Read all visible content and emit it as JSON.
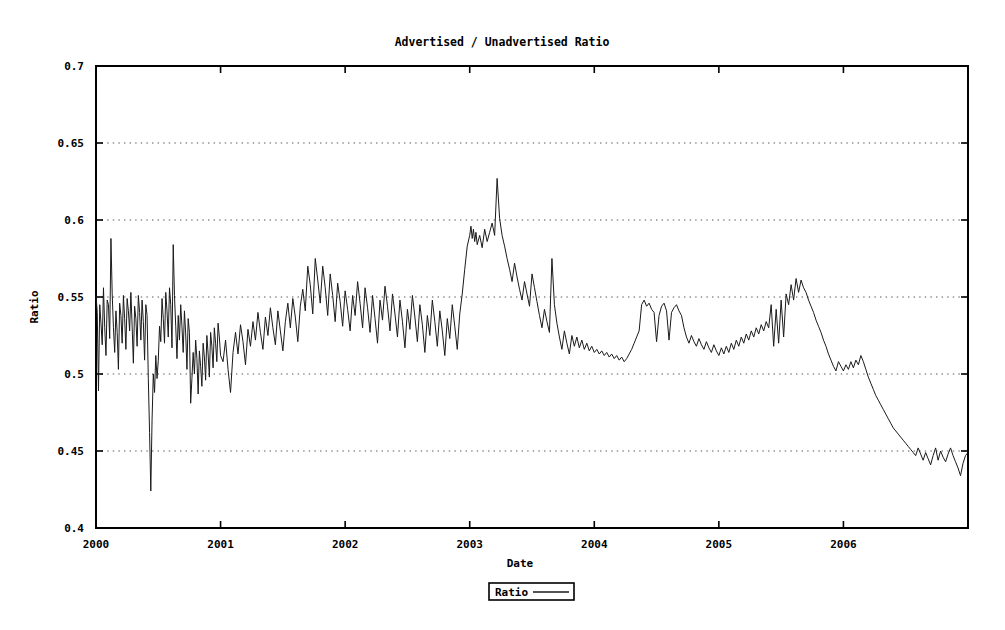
{
  "chart_data": {
    "type": "line",
    "title": "Advertised / Unadvertised Ratio",
    "xlabel": "Date",
    "ylabel": "Ratio",
    "ylim": [
      0.4,
      0.7
    ],
    "xlim": [
      2000.0,
      2007.0
    ],
    "ytick_labels": [
      "0.4",
      "0.45",
      "0.5",
      "0.55",
      "0.6",
      "0.65",
      "0.7"
    ],
    "ytick_values": [
      0.4,
      0.45,
      0.5,
      0.55,
      0.6,
      0.65,
      0.7
    ],
    "xtick_labels": [
      "2000",
      "2001",
      "2002",
      "2003",
      "2004",
      "2005",
      "2006",
      ""
    ],
    "xtick_values": [
      2000,
      2001,
      2002,
      2003,
      2004,
      2005,
      2006,
      2007
    ],
    "grid": true,
    "grid_style": "dotted",
    "legend_position": "below-center",
    "series": [
      {
        "name": "Ratio",
        "color": "#1a1a1a",
        "x": [
          2000.0,
          2000.01,
          2000.02,
          2000.03,
          2000.04,
          2000.05,
          2000.06,
          2000.07,
          2000.08,
          2000.09,
          2000.1,
          2000.11,
          2000.12,
          2000.13,
          2000.14,
          2000.15,
          2000.16,
          2000.17,
          2000.18,
          2000.19,
          2000.2,
          2000.21,
          2000.22,
          2000.23,
          2000.24,
          2000.25,
          2000.26,
          2000.27,
          2000.28,
          2000.29,
          2000.3,
          2000.31,
          2000.32,
          2000.33,
          2000.34,
          2000.35,
          2000.36,
          2000.37,
          2000.38,
          2000.39,
          2000.4,
          2000.41,
          2000.42,
          2000.43,
          2000.44,
          2000.45,
          2000.46,
          2000.47,
          2000.48,
          2000.49,
          2000.5,
          2000.51,
          2000.52,
          2000.53,
          2000.54,
          2000.55,
          2000.56,
          2000.57,
          2000.58,
          2000.59,
          2000.6,
          2000.61,
          2000.62,
          2000.63,
          2000.64,
          2000.65,
          2000.66,
          2000.67,
          2000.68,
          2000.69,
          2000.7,
          2000.71,
          2000.72,
          2000.73,
          2000.74,
          2000.75,
          2000.76,
          2000.77,
          2000.78,
          2000.79,
          2000.8,
          2000.81,
          2000.82,
          2000.83,
          2000.84,
          2000.85,
          2000.86,
          2000.87,
          2000.88,
          2000.89,
          2000.9,
          2000.91,
          2000.92,
          2000.93,
          2000.94,
          2000.95,
          2000.96,
          2000.97,
          2000.98,
          2000.99,
          2001.0,
          2001.02,
          2001.04,
          2001.06,
          2001.08,
          2001.1,
          2001.12,
          2001.14,
          2001.16,
          2001.18,
          2001.2,
          2001.22,
          2001.24,
          2001.26,
          2001.28,
          2001.3,
          2001.32,
          2001.34,
          2001.36,
          2001.38,
          2001.4,
          2001.42,
          2001.44,
          2001.46,
          2001.48,
          2001.5,
          2001.52,
          2001.54,
          2001.56,
          2001.58,
          2001.6,
          2001.62,
          2001.64,
          2001.66,
          2001.68,
          2001.7,
          2001.72,
          2001.74,
          2001.76,
          2001.78,
          2001.8,
          2001.82,
          2001.84,
          2001.86,
          2001.88,
          2001.9,
          2001.92,
          2001.94,
          2001.96,
          2001.98,
          2002.0,
          2002.02,
          2002.04,
          2002.06,
          2002.08,
          2002.1,
          2002.12,
          2002.14,
          2002.16,
          2002.18,
          2002.2,
          2002.22,
          2002.24,
          2002.26,
          2002.28,
          2002.3,
          2002.32,
          2002.34,
          2002.36,
          2002.38,
          2002.4,
          2002.42,
          2002.44,
          2002.46,
          2002.48,
          2002.5,
          2002.52,
          2002.54,
          2002.56,
          2002.58,
          2002.6,
          2002.62,
          2002.64,
          2002.66,
          2002.68,
          2002.7,
          2002.72,
          2002.74,
          2002.76,
          2002.78,
          2002.8,
          2002.82,
          2002.84,
          2002.86,
          2002.88,
          2002.9,
          2002.92,
          2002.94,
          2002.96,
          2002.98,
          2003.0,
          2003.01,
          2003.02,
          2003.03,
          2003.04,
          2003.05,
          2003.06,
          2003.08,
          2003.1,
          2003.12,
          2003.14,
          2003.16,
          2003.18,
          2003.2,
          2003.22,
          2003.24,
          2003.26,
          2003.28,
          2003.3,
          2003.32,
          2003.34,
          2003.36,
          2003.38,
          2003.4,
          2003.42,
          2003.44,
          2003.46,
          2003.48,
          2003.5,
          2003.52,
          2003.54,
          2003.56,
          2003.58,
          2003.6,
          2003.62,
          2003.64,
          2003.66,
          2003.68,
          2003.7,
          2003.72,
          2003.74,
          2003.76,
          2003.78,
          2003.8,
          2003.82,
          2003.84,
          2003.86,
          2003.88,
          2003.9,
          2003.92,
          2003.94,
          2003.96,
          2003.98,
          2004.0,
          2004.02,
          2004.04,
          2004.06,
          2004.08,
          2004.1,
          2004.12,
          2004.14,
          2004.16,
          2004.18,
          2004.2,
          2004.22,
          2004.24,
          2004.26,
          2004.28,
          2004.3,
          2004.32,
          2004.34,
          2004.36,
          2004.38,
          2004.4,
          2004.42,
          2004.44,
          2004.46,
          2004.48,
          2004.5,
          2004.52,
          2004.54,
          2004.56,
          2004.58,
          2004.6,
          2004.62,
          2004.64,
          2004.66,
          2004.68,
          2004.7,
          2004.72,
          2004.74,
          2004.76,
          2004.78,
          2004.8,
          2004.82,
          2004.84,
          2004.86,
          2004.88,
          2004.9,
          2004.92,
          2004.94,
          2004.96,
          2004.98,
          2005.0,
          2005.02,
          2005.04,
          2005.06,
          2005.08,
          2005.1,
          2005.12,
          2005.14,
          2005.16,
          2005.18,
          2005.2,
          2005.22,
          2005.24,
          2005.26,
          2005.28,
          2005.3,
          2005.32,
          2005.34,
          2005.36,
          2005.38,
          2005.4,
          2005.42,
          2005.44,
          2005.46,
          2005.48,
          2005.5,
          2005.52,
          2005.54,
          2005.56,
          2005.58,
          2005.6,
          2005.62,
          2005.64,
          2005.66,
          2005.68,
          2005.7,
          2005.72,
          2005.74,
          2005.76,
          2005.78,
          2005.8,
          2005.82,
          2005.84,
          2005.86,
          2005.88,
          2005.9,
          2005.92,
          2005.94,
          2005.96,
          2005.98,
          2006.0,
          2006.02,
          2006.04,
          2006.06,
          2006.08,
          2006.1,
          2006.12,
          2006.14,
          2006.16,
          2006.18,
          2006.2,
          2006.22,
          2006.24,
          2006.26,
          2006.28,
          2006.3,
          2006.32,
          2006.34,
          2006.36,
          2006.38,
          2006.4,
          2006.42,
          2006.44,
          2006.46,
          2006.48,
          2006.5,
          2006.52,
          2006.54,
          2006.56,
          2006.58,
          2006.6,
          2006.62,
          2006.64,
          2006.66,
          2006.68,
          2006.7,
          2006.72,
          2006.74,
          2006.76,
          2006.78,
          2006.8,
          2006.82,
          2006.84,
          2006.86,
          2006.88,
          2006.9,
          2006.92,
          2006.94,
          2006.96,
          2006.98,
          2007.0
        ],
        "y": [
          0.551,
          0.54,
          0.489,
          0.545,
          0.533,
          0.519,
          0.556,
          0.53,
          0.512,
          0.548,
          0.545,
          0.523,
          0.588,
          0.552,
          0.53,
          0.514,
          0.541,
          0.527,
          0.503,
          0.546,
          0.538,
          0.52,
          0.551,
          0.536,
          0.516,
          0.549,
          0.541,
          0.528,
          0.553,
          0.531,
          0.507,
          0.544,
          0.536,
          0.518,
          0.551,
          0.54,
          0.522,
          0.548,
          0.534,
          0.509,
          0.545,
          0.538,
          0.497,
          0.462,
          0.424,
          0.47,
          0.5,
          0.488,
          0.512,
          0.497,
          0.509,
          0.531,
          0.521,
          0.549,
          0.536,
          0.52,
          0.553,
          0.541,
          0.524,
          0.556,
          0.545,
          0.517,
          0.584,
          0.551,
          0.531,
          0.51,
          0.538,
          0.522,
          0.545,
          0.531,
          0.514,
          0.541,
          0.526,
          0.503,
          0.536,
          0.527,
          0.481,
          0.497,
          0.514,
          0.5,
          0.522,
          0.51,
          0.487,
          0.515,
          0.505,
          0.492,
          0.52,
          0.511,
          0.496,
          0.525,
          0.513,
          0.498,
          0.527,
          0.518,
          0.504,
          0.53,
          0.52,
          0.508,
          0.533,
          0.524,
          0.512,
          0.508,
          0.522,
          0.503,
          0.488,
          0.514,
          0.527,
          0.513,
          0.532,
          0.521,
          0.506,
          0.529,
          0.518,
          0.534,
          0.522,
          0.54,
          0.527,
          0.516,
          0.537,
          0.525,
          0.543,
          0.53,
          0.519,
          0.541,
          0.528,
          0.515,
          0.534,
          0.546,
          0.53,
          0.549,
          0.537,
          0.521,
          0.544,
          0.555,
          0.541,
          0.57,
          0.558,
          0.539,
          0.575,
          0.561,
          0.546,
          0.57,
          0.556,
          0.538,
          0.565,
          0.551,
          0.534,
          0.559,
          0.547,
          0.531,
          0.554,
          0.542,
          0.528,
          0.551,
          0.538,
          0.56,
          0.546,
          0.53,
          0.556,
          0.543,
          0.527,
          0.551,
          0.536,
          0.52,
          0.548,
          0.535,
          0.557,
          0.544,
          0.528,
          0.552,
          0.539,
          0.524,
          0.548,
          0.534,
          0.517,
          0.542,
          0.529,
          0.551,
          0.537,
          0.521,
          0.545,
          0.532,
          0.514,
          0.538,
          0.525,
          0.548,
          0.534,
          0.518,
          0.541,
          0.528,
          0.512,
          0.536,
          0.523,
          0.545,
          0.531,
          0.516,
          0.539,
          0.552,
          0.568,
          0.583,
          0.59,
          0.596,
          0.588,
          0.594,
          0.586,
          0.592,
          0.584,
          0.59,
          0.582,
          0.594,
          0.586,
          0.592,
          0.598,
          0.59,
          0.627,
          0.601,
          0.59,
          0.583,
          0.575,
          0.568,
          0.56,
          0.572,
          0.563,
          0.555,
          0.548,
          0.56,
          0.552,
          0.544,
          0.565,
          0.556,
          0.547,
          0.538,
          0.53,
          0.542,
          0.534,
          0.527,
          0.575,
          0.545,
          0.533,
          0.524,
          0.516,
          0.528,
          0.52,
          0.513,
          0.525,
          0.518,
          0.524,
          0.517,
          0.522,
          0.516,
          0.52,
          0.515,
          0.518,
          0.514,
          0.516,
          0.513,
          0.515,
          0.512,
          0.514,
          0.511,
          0.513,
          0.51,
          0.512,
          0.509,
          0.511,
          0.508,
          0.51,
          0.513,
          0.516,
          0.52,
          0.524,
          0.528,
          0.545,
          0.548,
          0.544,
          0.546,
          0.542,
          0.54,
          0.521,
          0.538,
          0.544,
          0.546,
          0.541,
          0.522,
          0.54,
          0.543,
          0.545,
          0.541,
          0.538,
          0.53,
          0.524,
          0.52,
          0.525,
          0.521,
          0.518,
          0.523,
          0.519,
          0.516,
          0.521,
          0.517,
          0.514,
          0.519,
          0.515,
          0.512,
          0.517,
          0.513,
          0.518,
          0.514,
          0.52,
          0.516,
          0.522,
          0.518,
          0.524,
          0.52,
          0.526,
          0.522,
          0.528,
          0.524,
          0.53,
          0.526,
          0.532,
          0.528,
          0.534,
          0.53,
          0.545,
          0.518,
          0.542,
          0.52,
          0.548,
          0.524,
          0.552,
          0.545,
          0.558,
          0.548,
          0.562,
          0.553,
          0.561,
          0.556,
          0.553,
          0.548,
          0.544,
          0.54,
          0.535,
          0.531,
          0.527,
          0.522,
          0.518,
          0.513,
          0.509,
          0.505,
          0.502,
          0.508,
          0.505,
          0.502,
          0.506,
          0.503,
          0.508,
          0.504,
          0.509,
          0.506,
          0.512,
          0.508,
          0.503,
          0.498,
          0.494,
          0.49,
          0.486,
          0.483,
          0.48,
          0.477,
          0.474,
          0.471,
          0.468,
          0.465,
          0.463,
          0.461,
          0.459,
          0.457,
          0.455,
          0.453,
          0.451,
          0.449,
          0.447,
          0.452,
          0.448,
          0.444,
          0.449,
          0.445,
          0.441,
          0.447,
          0.452,
          0.444,
          0.45,
          0.446,
          0.443,
          0.448,
          0.452,
          0.447,
          0.443,
          0.439,
          0.434,
          0.442,
          0.447,
          0.449
        ]
      }
    ],
    "annotations": {
      "max_value": 0.627,
      "min_value": 0.424,
      "trend": "Noisy around 0.52-0.55 through 2000-2002, peak near 0.63 in early 2003, declining to about 0.45 by 2007"
    }
  },
  "legend": {
    "entries": [
      {
        "label": "Ratio"
      }
    ]
  }
}
